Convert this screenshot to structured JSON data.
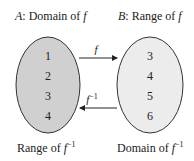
{
  "set_a": {
    "letter": "A",
    "title_rest": ": Domain of ",
    "func": "f",
    "bottom_label_prefix": "Range of ",
    "bottom_func": "f",
    "bottom_sup": "−1",
    "elements": [
      "1",
      "2",
      "3",
      "4"
    ],
    "fill": "#d0d0d0"
  },
  "set_b": {
    "letter": "B",
    "title_rest": ": Range of ",
    "func": "f",
    "bottom_label_prefix": "Domain of ",
    "bottom_func": "f",
    "bottom_sup": "−1",
    "elements": [
      "3",
      "4",
      "5",
      "6"
    ],
    "fill": "#ececec"
  },
  "arrows": {
    "forward_label": "f",
    "inverse_label": "f",
    "inverse_sup": "−1"
  }
}
